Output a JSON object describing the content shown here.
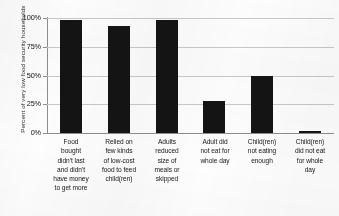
{
  "chart_data": {
    "type": "bar",
    "title": "",
    "xlabel": "",
    "ylabel": "Percent of very low food security households",
    "ylim": [
      0,
      100
    ],
    "yticks": [
      "0%",
      "25%",
      "50%",
      "75%",
      "100%"
    ],
    "ytick_values": [
      0,
      25,
      50,
      75,
      100
    ],
    "grid": true,
    "legend": "none",
    "bar_color": "#141414",
    "gridline_color": "#c9c9c9",
    "axis_color": "#8e8e8e",
    "categories": [
      "Food bought didn't last and didn't have money to get more",
      "Relied on few kinds of low-cost food to feed child(ren)",
      "Adults reduced size of meals or skipped",
      "Adult did not eat for whole day",
      "Child(ren) not eating enough",
      "Child(ren) did not eat for whole day"
    ],
    "category_lines": [
      [
        "Food",
        "bought",
        "didn't last",
        "and didn't",
        "have money",
        "to get more"
      ],
      [
        "Relied on",
        "few kinds",
        "of low-cost",
        "food to feed",
        "child(ren)"
      ],
      [
        "Adults",
        "reduced",
        "size of",
        "meals or",
        "skipped"
      ],
      [
        "Adult did",
        "not eat for",
        "whole day"
      ],
      [
        "Child(ren)",
        "not eating",
        "enough"
      ],
      [
        "Child(ren)",
        "did not eat",
        "for whole",
        "day"
      ]
    ],
    "values": [
      98,
      93,
      98,
      28,
      50,
      2
    ]
  }
}
